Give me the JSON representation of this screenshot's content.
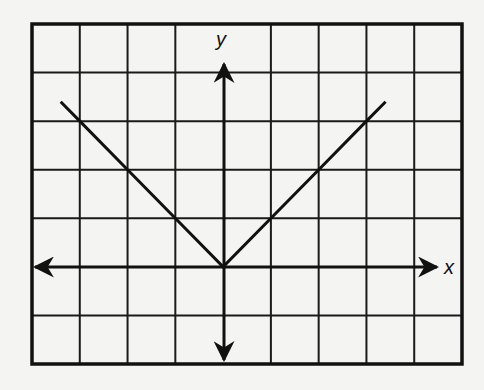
{
  "chart_data": {
    "type": "line",
    "title": "",
    "xlabel": "x",
    "ylabel": "y",
    "grid": true,
    "function": "y = |x|",
    "xlim": [
      -4,
      5
    ],
    "ylim": [
      -2,
      5
    ],
    "tick_labels": false,
    "series": [
      {
        "name": "y = |x|",
        "x": [
          -3.4,
          -3,
          -2,
          -1,
          0,
          1,
          2,
          3,
          3.4
        ],
        "y": [
          3.4,
          3,
          2,
          1,
          0,
          1,
          2,
          3,
          3.4
        ]
      }
    ],
    "axes": {
      "x_axis_arrows": "both",
      "y_axis_arrows": "both"
    }
  },
  "labels": {
    "x": "x",
    "y": "y"
  },
  "colors": {
    "background": "#f4f4f2",
    "grid": "#1a1a1a",
    "line": "#111111"
  }
}
